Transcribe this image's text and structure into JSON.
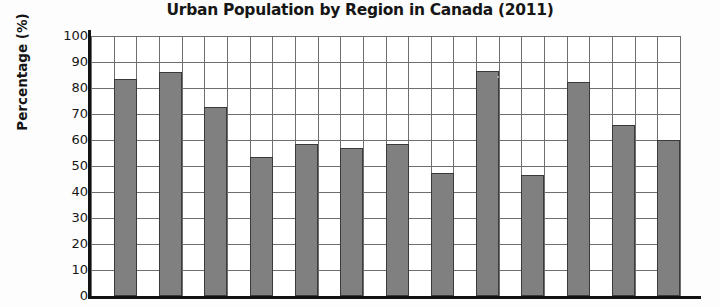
{
  "chart_data": {
    "type": "bar",
    "title": "Urban Population by Region in Canada (2011)",
    "xlabel": "",
    "ylabel": "Percentage (%)",
    "ylim": [
      0,
      100
    ],
    "ytick_step": 10,
    "yticks": [
      100,
      90,
      80,
      70,
      60,
      50,
      40,
      30,
      20,
      10,
      0
    ],
    "grid": true,
    "legend": "none",
    "bar_color": "#808080",
    "bar_edge_color": "#3a3a3a",
    "categories": [
      "",
      "",
      "",
      "",
      "",
      "",
      "",
      "",
      "",
      "",
      "",
      "",
      ""
    ],
    "values": [
      83.4,
      86.0,
      72.7,
      53.5,
      58.5,
      56.9,
      58.5,
      47.3,
      86.5,
      46.5,
      82.3,
      65.8,
      60.0
    ],
    "note": "x-axis category labels are cropped out of the visible image"
  },
  "axes": {
    "y_title": "Percentage (%)"
  }
}
